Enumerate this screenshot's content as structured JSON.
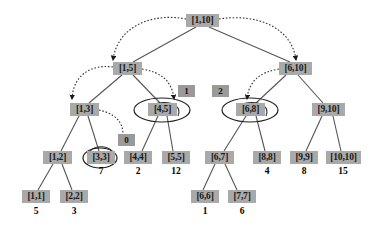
{
  "figure": {
    "type": "segment-tree-diagram",
    "colors": {
      "node_fill": "#a9a9a9",
      "badge_fill": "#9a9a9a",
      "edge": "#555555",
      "dotted_edge": "#333333",
      "ellipse": "#222222",
      "text": "#111111",
      "background": "#ffffff"
    }
  },
  "nodes": [
    {
      "id": "n1_10",
      "label": "[1,10]",
      "x": 186,
      "y": 14,
      "w": 33,
      "h": 13,
      "highlighted": false
    },
    {
      "id": "n1_5",
      "label": "[1,5]",
      "x": 113,
      "y": 62,
      "w": 29,
      "h": 13,
      "highlighted": false
    },
    {
      "id": "n6_10",
      "label": "[6,10]",
      "x": 279,
      "y": 62,
      "w": 33,
      "h": 13,
      "highlighted": false
    },
    {
      "id": "n1_3",
      "label": "[1,3]",
      "x": 70,
      "y": 103,
      "w": 29,
      "h": 13,
      "highlighted": false
    },
    {
      "id": "n4_5",
      "label": "[4,5]",
      "x": 148,
      "y": 103,
      "w": 29,
      "h": 13,
      "highlighted": true
    },
    {
      "id": "n6_8",
      "label": "[6,8]",
      "x": 236,
      "y": 103,
      "w": 29,
      "h": 13,
      "highlighted": true
    },
    {
      "id": "n9_10",
      "label": "[9,10]",
      "x": 312,
      "y": 103,
      "w": 33,
      "h": 13,
      "highlighted": false
    },
    {
      "id": "n1_2",
      "label": "[1,2]",
      "x": 43,
      "y": 151,
      "w": 29,
      "h": 13,
      "highlighted": false
    },
    {
      "id": "n3_3",
      "label": "[3,3]",
      "x": 87,
      "y": 151,
      "w": 28,
      "h": 13,
      "highlighted": true
    },
    {
      "id": "n4_4",
      "label": "[4,4]",
      "x": 124,
      "y": 151,
      "w": 28,
      "h": 13,
      "highlighted": false
    },
    {
      "id": "n5_5",
      "label": "[5,5]",
      "x": 162,
      "y": 151,
      "w": 28,
      "h": 13,
      "highlighted": false
    },
    {
      "id": "n6_7",
      "label": "[6,7]",
      "x": 205,
      "y": 151,
      "w": 29,
      "h": 13,
      "highlighted": false
    },
    {
      "id": "n8_8",
      "label": "[8,8]",
      "x": 253,
      "y": 151,
      "w": 28,
      "h": 13,
      "highlighted": false
    },
    {
      "id": "n9_9",
      "label": "[9,9]",
      "x": 290,
      "y": 151,
      "w": 28,
      "h": 13,
      "highlighted": false
    },
    {
      "id": "n10_10",
      "label": "[10,10]",
      "x": 326,
      "y": 151,
      "w": 35,
      "h": 13,
      "highlighted": false
    },
    {
      "id": "n1_1",
      "label": "[1,1]",
      "x": 22,
      "y": 190,
      "w": 28,
      "h": 13,
      "highlighted": false
    },
    {
      "id": "n2_2",
      "label": "[2,2]",
      "x": 60,
      "y": 190,
      "w": 28,
      "h": 13,
      "highlighted": false
    },
    {
      "id": "n6_6",
      "label": "[6,6]",
      "x": 191,
      "y": 190,
      "w": 28,
      "h": 13,
      "highlighted": false
    },
    {
      "id": "n7_7",
      "label": "[7,7]",
      "x": 228,
      "y": 190,
      "w": 28,
      "h": 13,
      "highlighted": false
    }
  ],
  "badges": [
    {
      "id": "b0",
      "label": "0",
      "x": 118,
      "y": 134,
      "w": 17,
      "h": 12
    },
    {
      "id": "b1",
      "label": "1",
      "x": 178,
      "y": 85,
      "w": 17,
      "h": 12
    },
    {
      "id": "b2",
      "label": "2",
      "x": 212,
      "y": 85,
      "w": 17,
      "h": 12
    }
  ],
  "leaf_values": [
    {
      "id": "v3_3",
      "label": "7",
      "cx": 101,
      "y": 166
    },
    {
      "id": "v4_4",
      "label": "2",
      "cx": 138,
      "y": 166
    },
    {
      "id": "v5_5",
      "label": "12",
      "cx": 176,
      "y": 166
    },
    {
      "id": "v8_8",
      "label": "4",
      "cx": 267,
      "y": 166
    },
    {
      "id": "v9_9",
      "label": "8",
      "cx": 304,
      "y": 166
    },
    {
      "id": "v10_10",
      "label": "15",
      "cx": 343,
      "y": 166
    },
    {
      "id": "v1_1",
      "label": "5",
      "cx": 36,
      "y": 206
    },
    {
      "id": "v2_2",
      "label": "3",
      "cx": 74,
      "y": 206
    },
    {
      "id": "v6_6",
      "label": "1",
      "cx": 205,
      "y": 206
    },
    {
      "id": "v7_7",
      "label": "6",
      "cx": 242,
      "y": 206
    }
  ],
  "tree_edges": [
    {
      "from": "n1_10",
      "to": "n1_5",
      "x1": 196,
      "y1": 27,
      "x2": 133,
      "y2": 62
    },
    {
      "from": "n1_10",
      "to": "n6_10",
      "x1": 209,
      "y1": 27,
      "x2": 290,
      "y2": 62
    },
    {
      "from": "n1_5",
      "to": "n1_3",
      "x1": 122,
      "y1": 75,
      "x2": 89,
      "y2": 103
    },
    {
      "from": "n1_5",
      "to": "n4_5",
      "x1": 133,
      "y1": 75,
      "x2": 160,
      "y2": 103
    },
    {
      "from": "n6_10",
      "to": "n6_8",
      "x1": 286,
      "y1": 75,
      "x2": 256,
      "y2": 103
    },
    {
      "from": "n6_10",
      "to": "n9_10",
      "x1": 298,
      "y1": 75,
      "x2": 323,
      "y2": 103
    },
    {
      "from": "n1_3",
      "to": "n1_2",
      "x1": 79,
      "y1": 116,
      "x2": 61,
      "y2": 151
    },
    {
      "from": "n1_3",
      "to": "n3_3",
      "x1": 88,
      "y1": 116,
      "x2": 99,
      "y2": 151
    },
    {
      "from": "n4_5",
      "to": "n4_4",
      "x1": 158,
      "y1": 116,
      "x2": 142,
      "y2": 151
    },
    {
      "from": "n4_5",
      "to": "n5_5",
      "x1": 167,
      "y1": 116,
      "x2": 173,
      "y2": 151
    },
    {
      "from": "n6_8",
      "to": "n6_7",
      "x1": 246,
      "y1": 116,
      "x2": 224,
      "y2": 151
    },
    {
      "from": "n6_8",
      "to": "n8_8",
      "x1": 256,
      "y1": 116,
      "x2": 265,
      "y2": 151
    },
    {
      "from": "n9_10",
      "to": "n9_9",
      "x1": 322,
      "y1": 116,
      "x2": 306,
      "y2": 151
    },
    {
      "from": "n9_10",
      "to": "n10_10",
      "x1": 333,
      "y1": 116,
      "x2": 341,
      "y2": 151
    },
    {
      "from": "n1_2",
      "to": "n1_1",
      "x1": 53,
      "y1": 164,
      "x2": 38,
      "y2": 190
    },
    {
      "from": "n1_2",
      "to": "n2_2",
      "x1": 62,
      "y1": 164,
      "x2": 72,
      "y2": 190
    },
    {
      "from": "n6_7",
      "to": "n6_6",
      "x1": 215,
      "y1": 164,
      "x2": 203,
      "y2": 190
    },
    {
      "from": "n6_7",
      "to": "n7_7",
      "x1": 225,
      "y1": 164,
      "x2": 237,
      "y2": 190
    }
  ],
  "traversal_arrows": [
    {
      "id": "a-root-left",
      "path": "M 186,19 C 150,12 117,28 113,60",
      "arrow_at": [
        115,
        68
      ],
      "arrow_dir": "down"
    },
    {
      "id": "a-root-right",
      "path": "M 219,19 C 258,13 292,28 296,60",
      "arrow_at": [
        294,
        68
      ],
      "arrow_dir": "down"
    },
    {
      "id": "a-1_5-left",
      "path": "M 113,67 C 90,64 73,76 72,99",
      "arrow_at": [
        73,
        107
      ],
      "arrow_dir": "down"
    },
    {
      "id": "a-1_5-right",
      "path": "M 142,69 C 160,72 172,80 174,99",
      "arrow_at": [
        175,
        107
      ],
      "arrow_dir": "down"
    },
    {
      "id": "a-6_10-left",
      "path": "M 279,69 C 261,72 249,80 247,99",
      "arrow_at": [
        246,
        107
      ],
      "arrow_dir": "down"
    },
    {
      "id": "a-1_3-right",
      "path": "M 99,110 C 117,114 126,124 122,142",
      "arrow_at": [
        118,
        148
      ],
      "arrow_dir": "down-right"
    }
  ],
  "highlight_ellipses": [
    {
      "for": "n4_5",
      "cx": 162,
      "cy": 110,
      "rx": 28,
      "ry": 12
    },
    {
      "for": "n6_8",
      "cx": 250,
      "cy": 110,
      "rx": 28,
      "ry": 12
    },
    {
      "for": "n3_3",
      "cx": 100,
      "cy": 158,
      "rx": 17,
      "ry": 10
    }
  ],
  "self_loops": [
    {
      "for": "n4_5",
      "path": "M 150,116 C 142,98 186,98 178,116"
    },
    {
      "for": "n6_8",
      "path": "M 238,116 C 230,98 274,98 266,116"
    },
    {
      "for": "n3_3",
      "path": "M 89,161 C 82,142 120,142 113,161"
    }
  ]
}
